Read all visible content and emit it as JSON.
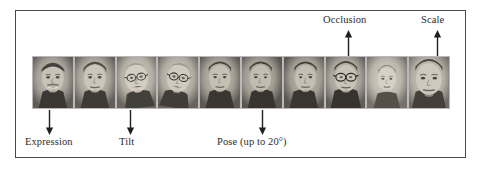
{
  "figure": {
    "caption_labels_below": [
      {
        "id": "expression",
        "text": "Expression",
        "arrow_direction": "down"
      },
      {
        "id": "tilt",
        "text": "Tilt",
        "arrow_direction": "down"
      },
      {
        "id": "pose",
        "text": "Pose (up to 20°)",
        "arrow_direction": "down"
      }
    ],
    "caption_labels_above": [
      {
        "id": "occlusion",
        "text": "Occlusion",
        "arrow_direction": "up"
      },
      {
        "id": "scale",
        "text": "Scale",
        "arrow_direction": "up"
      }
    ],
    "face_count": 10,
    "faces": [
      {
        "index": 1,
        "variation": "expression-smiling",
        "skin": "#b9b3ab",
        "glasses": false,
        "mustache": true
      },
      {
        "index": 2,
        "variation": "expression-neutral",
        "skin": "#bcb6ae",
        "glasses": false,
        "mustache": false
      },
      {
        "index": 3,
        "variation": "tilt-left",
        "skin": "#c6c0b6",
        "glasses": true,
        "mustache": false
      },
      {
        "index": 4,
        "variation": "tilt-right",
        "skin": "#c3bdb3",
        "glasses": true,
        "mustache": false
      },
      {
        "index": 5,
        "variation": "pose-frontal",
        "skin": "#b4aea6",
        "glasses": false,
        "mustache": false
      },
      {
        "index": 6,
        "variation": "pose-left",
        "skin": "#b0aaa2",
        "glasses": false,
        "mustache": false
      },
      {
        "index": 7,
        "variation": "pose-right",
        "skin": "#b2aca4",
        "glasses": false,
        "mustache": false
      },
      {
        "index": 8,
        "variation": "occlusion-glasses",
        "skin": "#b8b2aa",
        "glasses": true,
        "mustache": false
      },
      {
        "index": 9,
        "variation": "scale-small",
        "skin": "#c8c2ba",
        "glasses": false,
        "mustache": false
      },
      {
        "index": 10,
        "variation": "scale-large",
        "skin": "#c0bab2",
        "glasses": false,
        "mustache": false
      }
    ],
    "colors": {
      "frame_border": "#4a4a4a",
      "text": "#2b2b2b",
      "arrow": "#1f1f1f",
      "background": "#ffffff"
    }
  }
}
